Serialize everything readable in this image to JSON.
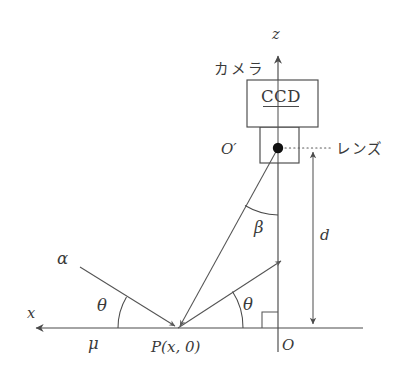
{
  "figure": {
    "background_color": "#ffffff",
    "line_color": "#4a4a4a",
    "text_color": "#3a3a3a",
    "dot_color": "#111111"
  },
  "labels": {
    "z_axis": "z",
    "x_axis": "x",
    "camera": "カメラ",
    "ccd": "CCD",
    "lens": "レンズ",
    "origin_prime": "O′",
    "origin": "O",
    "point_p": "P(x, 0)",
    "alpha": "α",
    "beta": "β",
    "theta_left": "θ",
    "theta_right": "θ",
    "mu": "μ",
    "distance_d": "d"
  },
  "geometry": {
    "z_axis": {
      "x": 278,
      "y_top": 52,
      "y_bottom": 352
    },
    "x_axis": {
      "y": 328,
      "x_left": 32,
      "x_right": 363
    },
    "point_p": {
      "x": 178,
      "y": 328
    },
    "point_o": {
      "x": 278,
      "y": 328
    },
    "point_o_prime": {
      "x": 278,
      "y": 148
    },
    "ccd_box": {
      "x": 247,
      "y": 80,
      "width": 71,
      "height": 47
    },
    "lens_box": {
      "x": 260,
      "y": 127,
      "width": 39,
      "height": 36
    },
    "incident_ray": {
      "x1": 80,
      "y1": 267,
      "x2": 178,
      "y2": 328
    },
    "reflected_ray": {
      "x1": 178,
      "y1": 328,
      "x2": 282,
      "y2": 260
    },
    "sight_line": {
      "x1": 178,
      "y1": 328,
      "x2": 278,
      "y2": 148
    },
    "dimension_d": {
      "x": 313,
      "y_top": 148,
      "y_bottom": 328
    },
    "lens_pointer": {
      "x_from": 286,
      "x_to": 333,
      "y": 148,
      "arrow_x": 313
    },
    "right_angle": {
      "x": 262,
      "y": 312,
      "size": 16
    },
    "theta_left_arc_deg": 32,
    "theta_right_arc_deg": 33,
    "beta_arc_deg": 29
  },
  "annotations": {
    "ccd_underline": true,
    "lens_callout_dotted": true,
    "x_axis_arrow": "left",
    "z_axis_arrow": "up"
  }
}
